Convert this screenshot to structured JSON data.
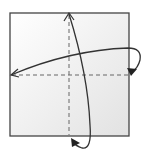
{
  "diagram": {
    "type": "origami-fold-step",
    "paper": {
      "x": 10,
      "y": 13,
      "width": 119,
      "height": 123,
      "fill_light": "#ffffff",
      "fill_dark": "#e2e2e2",
      "stroke": "#444444"
    },
    "fold_lines": [
      {
        "name": "vertical-center-valley-fold",
        "x1": 69,
        "y1": 13,
        "x2": 69,
        "y2": 136,
        "style": "dashed"
      },
      {
        "name": "horizontal-center-valley-fold",
        "x1": 10,
        "y1": 75,
        "x2": 129,
        "y2": 75,
        "style": "dashed"
      }
    ],
    "arrows": [
      {
        "name": "fold-right-to-left-arrow",
        "direction": "right edge folds to left"
      },
      {
        "name": "fold-bottom-to-top-arrow",
        "direction": "bottom edge folds to top"
      }
    ],
    "colors": {
      "line": "#333333",
      "dash": "#666666"
    }
  }
}
